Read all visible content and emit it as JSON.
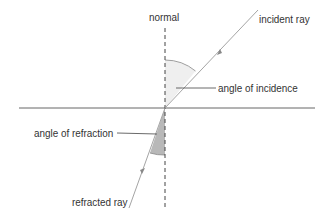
{
  "diagram": {
    "labels": {
      "normal": "normal",
      "incident_ray": "incident ray",
      "angle_of_incidence": "angle of incidence",
      "angle_of_refraction": "angle of refraction",
      "refracted_ray": "refracted ray"
    },
    "colors": {
      "ray": "#9a9a9a",
      "boundary": "#555555",
      "normal": "#444444",
      "incidence_fill": "#ececec",
      "refraction_fill": "#b5b5b5",
      "text": "#333333"
    }
  }
}
